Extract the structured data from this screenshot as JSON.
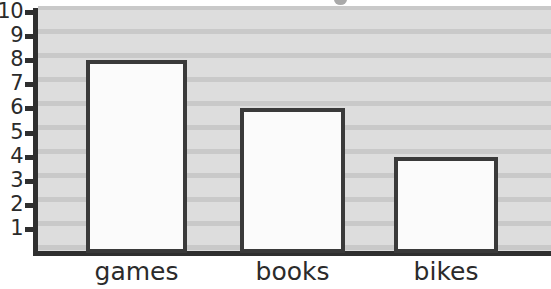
{
  "chart_data": {
    "type": "bar",
    "title": "",
    "xlabel": "",
    "ylabel": "",
    "categories": [
      "games",
      "books",
      "bikes"
    ],
    "values": [
      8,
      6,
      4
    ],
    "series": [
      {
        "name": "count",
        "values": [
          8,
          6,
          4
        ]
      }
    ],
    "ylim": [
      0,
      10
    ],
    "y_ticks": [
      10,
      9,
      8,
      7,
      6,
      5,
      4,
      3,
      2,
      1
    ],
    "y_tick_labels": [
      "10",
      "9",
      "8",
      "7",
      "6",
      "5",
      "4",
      "3",
      "2",
      "1"
    ],
    "grid": true,
    "grid_orientation": "horizontal",
    "legend": false,
    "legend_position": "none",
    "colors": {
      "bar_fill": "#fbfbfb",
      "bar_border": "#3a3a3a",
      "axis": "#2f2f2f",
      "plot_background": "#dcdcdc",
      "grid_line": "#c9c9c9",
      "text": "#2b2b2b",
      "page_background": "#ffffff"
    }
  },
  "axis": {
    "ticks": [
      {
        "label": "10",
        "value": 10
      },
      {
        "label": "9",
        "value": 9
      },
      {
        "label": "8",
        "value": 8
      },
      {
        "label": "7",
        "value": 7
      },
      {
        "label": "6",
        "value": 6
      },
      {
        "label": "5",
        "value": 5
      },
      {
        "label": "4",
        "value": 4
      },
      {
        "label": "3",
        "value": 3
      },
      {
        "label": "2",
        "value": 2
      },
      {
        "label": "1",
        "value": 1
      }
    ]
  },
  "bars": [
    {
      "label": "games",
      "value": 8
    },
    {
      "label": "books",
      "value": 6
    },
    {
      "label": "bikes",
      "value": 4
    }
  ]
}
